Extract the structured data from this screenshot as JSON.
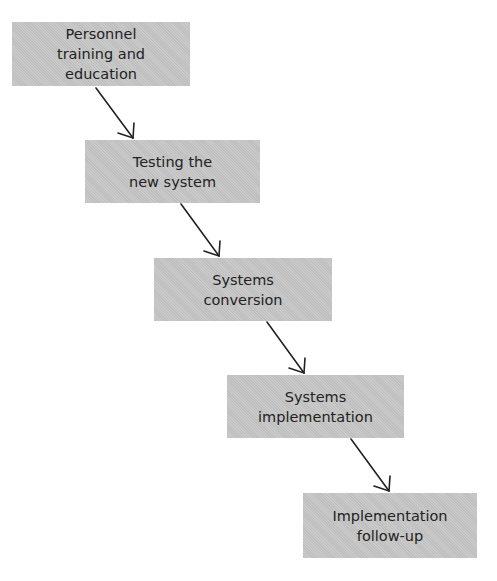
{
  "diagram": {
    "type": "flowchart-staircase",
    "box_color": "#c6c6c6",
    "text_color": "#222222",
    "arrow_color": "#222222",
    "steps": [
      {
        "label": "Personnel\ntraining and\neducation",
        "x": 12,
        "y": 22,
        "w": 178,
        "h": 64
      },
      {
        "label": "Testing the\nnew system",
        "x": 85,
        "y": 140,
        "w": 175,
        "h": 63
      },
      {
        "label": "Systems\nconversion",
        "x": 154,
        "y": 258,
        "w": 178,
        "h": 63
      },
      {
        "label": "Systems\nimplementation",
        "x": 227,
        "y": 375,
        "w": 177,
        "h": 63
      },
      {
        "label": "Implementation\nfollow-up",
        "x": 303,
        "y": 493,
        "w": 174,
        "h": 65
      }
    ],
    "arrows": [
      {
        "from": "step-1",
        "to": "step-2"
      },
      {
        "from": "step-2",
        "to": "step-3"
      },
      {
        "from": "step-3",
        "to": "step-4"
      },
      {
        "from": "step-4",
        "to": "step-5"
      }
    ]
  }
}
